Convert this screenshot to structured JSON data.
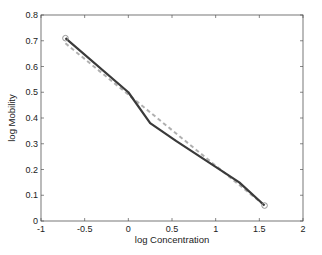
{
  "chart_data": {
    "type": "line",
    "title": "",
    "xlabel": "log Concentration",
    "ylabel": "log Mobility",
    "xlim": [
      -1,
      2
    ],
    "ylim": [
      0,
      0.8
    ],
    "xticks": [
      -1,
      -0.5,
      0,
      0.5,
      1,
      1.5,
      2
    ],
    "xtick_labels": [
      "-1",
      "-0.5",
      "0",
      "0.5",
      "1",
      "1.5",
      "2"
    ],
    "yticks": [
      0,
      0.1,
      0.2,
      0.3,
      0.4,
      0.5,
      0.6,
      0.7,
      0.8
    ],
    "ytick_labels": [
      "0",
      "0.1",
      "0.2",
      "0.3",
      "0.4",
      "0.5",
      "0.6",
      "0.7",
      "0.8"
    ],
    "grid": false,
    "legend": null,
    "series": [
      {
        "name": "measured",
        "style": "solid dark line with circle markers at ends",
        "color": "#3a3a3a",
        "x": [
          -0.72,
          0.0,
          0.25,
          0.55,
          1.0,
          1.27,
          1.56
        ],
        "y": [
          0.71,
          0.5,
          0.38,
          0.31,
          0.21,
          0.15,
          0.06
        ]
      },
      {
        "name": "linear fit",
        "style": "dashed light gray line",
        "color": "#b0b0b0",
        "x": [
          -0.72,
          1.56
        ],
        "y": [
          0.69,
          0.06
        ]
      }
    ]
  }
}
